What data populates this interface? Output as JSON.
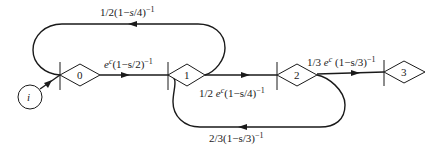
{
  "diagram": {
    "type": "state-transition flow graph",
    "nodes": [
      {
        "id": "i",
        "label": "i",
        "shape": "circle"
      },
      {
        "id": "0",
        "label": "0",
        "shape": "diamond"
      },
      {
        "id": "1",
        "label": "1",
        "shape": "diamond"
      },
      {
        "id": "2",
        "label": "2",
        "shape": "diamond"
      },
      {
        "id": "3",
        "label": "3",
        "shape": "diamond"
      }
    ],
    "edges": [
      {
        "from": "i",
        "to": "0",
        "label": ""
      },
      {
        "from": "0",
        "to": "1",
        "label_parts": [
          "e",
          "c",
          "(1−s/2)",
          "−1"
        ]
      },
      {
        "from": "1",
        "to": "0",
        "label_parts": [
          "1/2(1−",
          "s",
          "/4)",
          "−1"
        ],
        "route": "top-loop"
      },
      {
        "from": "1",
        "to": "2",
        "label_parts": [
          "1/2 ",
          "e",
          "c",
          "(1−s/4)",
          "−1"
        ]
      },
      {
        "from": "2",
        "to": "1",
        "label_parts": [
          "2/3(1−s/3)",
          "−1"
        ],
        "route": "bottom-loop"
      },
      {
        "from": "2",
        "to": "3",
        "label_parts": [
          "1/3 ",
          "e",
          "c",
          " (1−s/3)",
          "−1"
        ]
      }
    ]
  }
}
